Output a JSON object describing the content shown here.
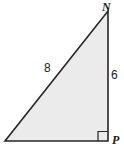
{
  "figure": {
    "kind": "right-triangle-geometry-diagram",
    "canvas": {
      "width": 124,
      "height": 161
    },
    "background_color": "#ffffff",
    "shape": {
      "name": "triangle",
      "fill_color": "#ebebeb",
      "stroke_color": "#262626",
      "stroke_width": 1.6,
      "points": "108,11 108,141 5,141",
      "vertices": [
        {
          "label": "N",
          "x": 108,
          "y": 11
        },
        {
          "label": "P",
          "x": 108,
          "y": 141
        },
        {
          "label": "",
          "x": 5,
          "y": 141
        }
      ]
    },
    "right_angle_marker": {
      "at_vertex": "P",
      "stroke_color": "#262626",
      "stroke_width": 1.2,
      "fill": "none",
      "points": "98,141 98,131.5 107.5,131.5"
    },
    "vertex_labels": [
      {
        "id": "N",
        "text": "N"
      },
      {
        "id": "P",
        "text": "P"
      }
    ],
    "side_labels": [
      {
        "id": "hypotenuse",
        "text": "8"
      },
      {
        "id": "leg_vertical",
        "text": "6"
      }
    ]
  }
}
